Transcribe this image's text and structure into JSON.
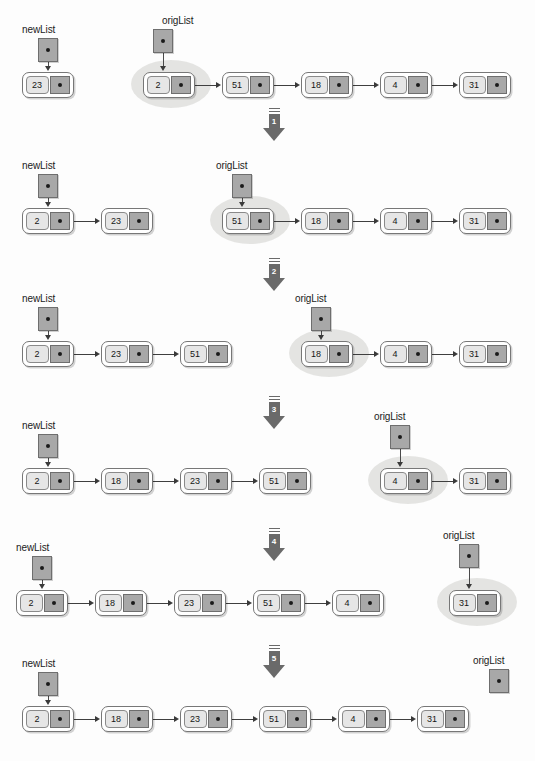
{
  "diagram": {
    "pointer_names": {
      "new_list": "newList",
      "orig_list": "origList"
    },
    "colors": {
      "node_fill": "#ffffff",
      "node_border": "#777777",
      "data_cell": "#e6e6e6",
      "pointer_cell": "#a8a8a8",
      "highlight": "#e2e2e0",
      "arrow": "#6a6a6a",
      "text": "#161616",
      "background": "#fdfdfd"
    },
    "initial_values": [
      2,
      51,
      18,
      4,
      31
    ],
    "seed_value": 23,
    "final_values": [
      2,
      18,
      23,
      51,
      4,
      31
    ]
  },
  "step_arrows": [
    {
      "label": "1",
      "x": 260,
      "y": 108
    },
    {
      "label": "2",
      "x": 260,
      "y": 258
    },
    {
      "label": "3",
      "x": 260,
      "y": 396
    },
    {
      "label": "4",
      "x": 260,
      "y": 528
    },
    {
      "label": "5",
      "x": 260,
      "y": 645
    }
  ],
  "rows": [
    {
      "index": 0,
      "new_list": {
        "label": "newList",
        "label_x": 22,
        "label_y": 24,
        "box_x": 38,
        "box_y": 38,
        "nodes": [
          {
            "value": "23",
            "x": 22,
            "y": 72
          }
        ]
      },
      "orig_list": {
        "label": "origList",
        "label_x": 162,
        "label_y": 15,
        "box_x": 153,
        "box_y": 29,
        "highlight": {
          "x": 131,
          "y": 60,
          "w": 80,
          "h": 48
        },
        "nodes": [
          {
            "value": "2",
            "x": 143,
            "y": 72
          },
          {
            "value": "51",
            "x": 222,
            "y": 72
          },
          {
            "value": "18",
            "x": 301,
            "y": 72
          },
          {
            "value": "4",
            "x": 380,
            "y": 72
          },
          {
            "value": "31",
            "x": 459,
            "y": 72
          }
        ]
      }
    },
    {
      "index": 1,
      "new_list": {
        "label": "newList",
        "label_x": 22,
        "label_y": 160,
        "box_x": 38,
        "box_y": 174,
        "nodes": [
          {
            "value": "2",
            "x": 22,
            "y": 208
          },
          {
            "value": "23",
            "x": 101,
            "y": 208
          }
        ]
      },
      "orig_list": {
        "label": "origList",
        "label_x": 216,
        "label_y": 160,
        "box_x": 232,
        "box_y": 174,
        "highlight": {
          "x": 210,
          "y": 196,
          "w": 80,
          "h": 48
        },
        "nodes": [
          {
            "value": "51",
            "x": 222,
            "y": 208
          },
          {
            "value": "18",
            "x": 301,
            "y": 208
          },
          {
            "value": "4",
            "x": 380,
            "y": 208
          },
          {
            "value": "31",
            "x": 459,
            "y": 208
          }
        ]
      }
    },
    {
      "index": 2,
      "new_list": {
        "label": "newList",
        "label_x": 22,
        "label_y": 293,
        "box_x": 38,
        "box_y": 307,
        "nodes": [
          {
            "value": "2",
            "x": 22,
            "y": 341
          },
          {
            "value": "23",
            "x": 101,
            "y": 341
          },
          {
            "value": "51",
            "x": 180,
            "y": 341
          }
        ]
      },
      "orig_list": {
        "label": "origList",
        "label_x": 295,
        "label_y": 293,
        "box_x": 311,
        "box_y": 307,
        "highlight": {
          "x": 289,
          "y": 329,
          "w": 80,
          "h": 48
        },
        "nodes": [
          {
            "value": "18",
            "x": 301,
            "y": 341
          },
          {
            "value": "4",
            "x": 380,
            "y": 341
          },
          {
            "value": "31",
            "x": 459,
            "y": 341
          }
        ]
      }
    },
    {
      "index": 3,
      "new_list": {
        "label": "newList",
        "label_x": 22,
        "label_y": 420,
        "box_x": 38,
        "box_y": 434,
        "nodes": [
          {
            "value": "2",
            "x": 22,
            "y": 468
          },
          {
            "value": "18",
            "x": 101,
            "y": 468
          },
          {
            "value": "23",
            "x": 180,
            "y": 468
          },
          {
            "value": "51",
            "x": 259,
            "y": 468
          }
        ]
      },
      "orig_list": {
        "label": "origList",
        "label_x": 374,
        "label_y": 411,
        "box_x": 390,
        "box_y": 425,
        "highlight": {
          "x": 368,
          "y": 456,
          "w": 80,
          "h": 48
        },
        "nodes": [
          {
            "value": "4",
            "x": 380,
            "y": 468
          },
          {
            "value": "31",
            "x": 459,
            "y": 468
          }
        ]
      }
    },
    {
      "index": 4,
      "new_list": {
        "label": "newList",
        "label_x": 16,
        "label_y": 542,
        "box_x": 32,
        "box_y": 556,
        "nodes": [
          {
            "value": "2",
            "x": 16,
            "y": 590
          },
          {
            "value": "18",
            "x": 95,
            "y": 590
          },
          {
            "value": "23",
            "x": 174,
            "y": 590
          },
          {
            "value": "51",
            "x": 253,
            "y": 590
          },
          {
            "value": "4",
            "x": 332,
            "y": 590
          }
        ]
      },
      "orig_list": {
        "label": "origList",
        "label_x": 443,
        "label_y": 530,
        "box_x": 459,
        "box_y": 544,
        "highlight": {
          "x": 437,
          "y": 578,
          "w": 80,
          "h": 48
        },
        "nodes": [
          {
            "value": "31",
            "x": 449,
            "y": 590
          }
        ]
      }
    },
    {
      "index": 5,
      "new_list": {
        "label": "newList",
        "label_x": 22,
        "label_y": 658,
        "box_x": 38,
        "box_y": 672,
        "nodes": [
          {
            "value": "2",
            "x": 22,
            "y": 706
          },
          {
            "value": "18",
            "x": 101,
            "y": 706
          },
          {
            "value": "23",
            "x": 180,
            "y": 706
          },
          {
            "value": "51",
            "x": 259,
            "y": 706
          },
          {
            "value": "4",
            "x": 338,
            "y": 706
          },
          {
            "value": "31",
            "x": 417,
            "y": 706
          }
        ]
      },
      "orig_list": {
        "label": "origList",
        "label_x": 473,
        "label_y": 655,
        "box_x": 489,
        "box_y": 669,
        "highlight": null,
        "nodes": []
      }
    }
  ]
}
